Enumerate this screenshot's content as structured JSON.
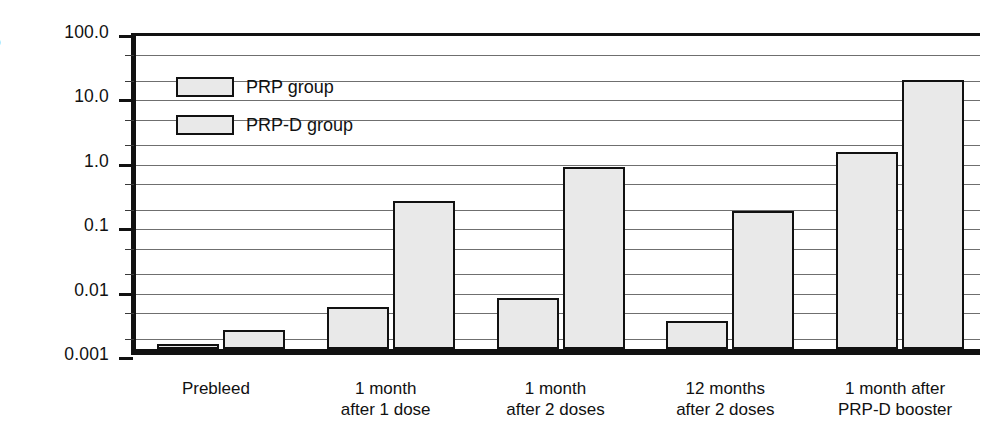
{
  "chart_data": {
    "type": "bar",
    "title": "",
    "xlabel": "",
    "ylabel": "Ug PRP antibody/ml",
    "yscale": "log",
    "ylim": [
      0.001,
      100.0
    ],
    "grid": true,
    "legend_position": "top-left",
    "categories": [
      "Prebleed",
      "1 month after 1 dose",
      "1 month after 2 doses",
      "12 months after 2 doses",
      "1 month after PRP-D booster"
    ],
    "category_lines": [
      [
        "Prebleed",
        ""
      ],
      [
        "1 month",
        "after 1 dose"
      ],
      [
        "1 month",
        "after 2 doses"
      ],
      [
        "12 months",
        "after 2 doses"
      ],
      [
        "1 month after",
        "PRP-D booster"
      ]
    ],
    "series": [
      {
        "name": "PRP group",
        "values": [
          0.0012,
          0.0045,
          0.0062,
          0.0027,
          1.15
        ]
      },
      {
        "name": "PRP-D group",
        "values": [
          0.002,
          0.2,
          0.68,
          0.14,
          15.0
        ]
      }
    ],
    "ytick_labels": [
      "100.0",
      "10.0",
      "1.0",
      "0.1",
      "0.01",
      "0.001"
    ],
    "ytick_values": [
      100.0,
      10.0,
      1.0,
      0.1,
      0.01,
      0.001
    ],
    "minor_gridline_values": [
      50,
      20,
      5,
      2,
      0.5,
      0.2,
      0.05,
      0.02,
      0.005,
      0.002
    ],
    "colors": {
      "bar_fill": "#e9e9e9",
      "bar_stroke": "#111111",
      "gridline": "#6f6f6f",
      "axis": "#111111",
      "text": "#111111",
      "background": "#ffffff"
    }
  },
  "legend": {
    "items": [
      {
        "label": "PRP group"
      },
      {
        "label": "PRP-D group"
      }
    ]
  },
  "axis": {
    "y_title": "Ug PRP antibody/ml"
  }
}
